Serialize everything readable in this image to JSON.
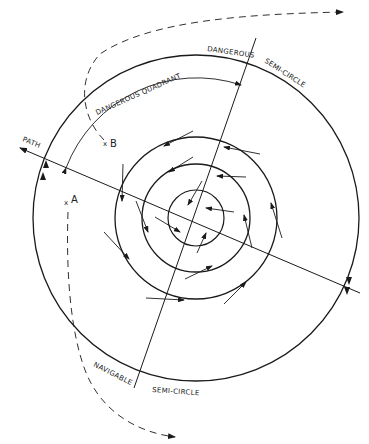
{
  "diagram": {
    "labels": {
      "dangerous": "DANGEROUS",
      "semi_circle_top": "SEMI-CIRCLE",
      "dangerous_quadrant": "DANGEROUS QUADRANT",
      "path": "PATH",
      "navigable": "NAVIGABLE",
      "semi_circle_bottom": "SEMI-CIRCLE",
      "point_a": "A",
      "point_b": "B",
      "mark_x": "x"
    },
    "colors": {
      "line": "#1a1a1a",
      "background": "#ffffff"
    }
  }
}
